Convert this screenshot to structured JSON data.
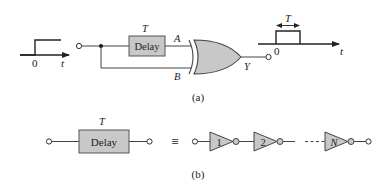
{
  "figure": {
    "part_a": {
      "caption": "(a)",
      "input_waveform": {
        "origin_label": "0",
        "axis_label": "t",
        "type": "step"
      },
      "delay_block": {
        "label": "Delay",
        "delay_label": "T"
      },
      "gate": {
        "type": "XOR",
        "input_a_label": "A",
        "input_b_label": "B",
        "output_label": "Y"
      },
      "output_waveform": {
        "origin_label": "0",
        "axis_label": "t",
        "width_label": "T",
        "type": "pulse"
      }
    },
    "part_b": {
      "caption": "(b)",
      "delay_block": {
        "label": "Delay",
        "delay_label": "T"
      },
      "equivalence_symbol": "≡",
      "inverters": [
        {
          "label": "1"
        },
        {
          "label": "2"
        },
        {
          "label": "N"
        }
      ]
    }
  },
  "colors": {
    "stroke": "#333333",
    "fill_gray": "#c8c8c8",
    "background": "#ffffff"
  }
}
